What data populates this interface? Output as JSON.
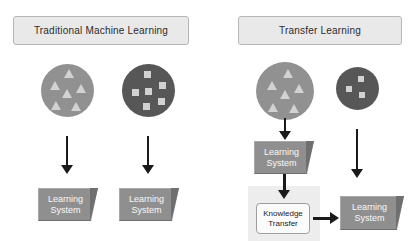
{
  "diagram": {
    "title_left": "Traditional Machine Learning",
    "title_right": "Transfer Learning",
    "palette": {
      "header_fill": "#e9e9e9",
      "header_border": "#b6b6b6",
      "circle_light": "#919191",
      "circle_dark": "#575757",
      "shape_fill": "#d2d2d2",
      "block_face": "#8f8f8f",
      "block_bevel": "#6f6f6f",
      "block_text": "#fafafa",
      "panel_fill": "#ededed",
      "arrow": "#1a1a1a",
      "kt_fill": "#fbfbfb",
      "kt_border": "#9e9e9e",
      "kt_text": "#222222"
    }
  },
  "left_panel": {
    "header": "Traditional Machine Learning",
    "source_domain": {
      "name": "triangle-domain",
      "shape": "triangle",
      "count": 6
    },
    "target_domain": {
      "name": "square-domain",
      "shape": "square",
      "count": 6
    },
    "outputs": [
      {
        "line1": "Learning",
        "line2": "System"
      },
      {
        "line1": "Learning",
        "line2": "System"
      }
    ]
  },
  "right_panel": {
    "header": "Transfer Learning",
    "source_domain": {
      "name": "triangle-domain",
      "shape": "triangle",
      "count": 6
    },
    "target_domain": {
      "name": "square-domain",
      "shape": "square",
      "count": 3
    },
    "learning_system_source": {
      "line1": "Learning",
      "line2": "System"
    },
    "knowledge_transfer": {
      "line1": "Knowledge",
      "line2": "Transfer"
    },
    "learning_system_target": {
      "line1": "Learning",
      "line2": "System"
    }
  }
}
